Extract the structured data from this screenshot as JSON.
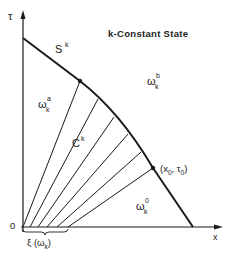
{
  "diagram": {
    "title": "k-Constant State",
    "axes": {
      "vertical_label": "τ",
      "horizontal_label": "x",
      "origin_label": "0"
    },
    "curve": {
      "label_main": "S",
      "label_sup": "k"
    },
    "fan": {
      "label_main": "C",
      "label_sup": "k"
    },
    "regions": {
      "a": {
        "main": "ω",
        "sup": "a",
        "sub": "k"
      },
      "b": {
        "main": "ω",
        "sup": "b",
        "sub": "k"
      },
      "zero": {
        "main": "ω",
        "sup": "0",
        "sub": "k"
      }
    },
    "point": {
      "label": "(x",
      "sub0": "0",
      "mid": ", τ",
      "sub1": "0",
      "end": ")"
    },
    "interval": {
      "label": "ξ (ω",
      "sub": "k",
      "end": ")"
    },
    "colors": {
      "line": "#1a1a1a",
      "background": "#ffffff"
    }
  }
}
